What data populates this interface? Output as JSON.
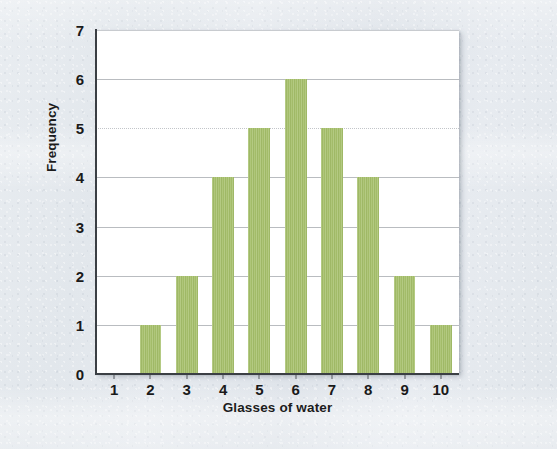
{
  "chart_data": {
    "type": "bar",
    "title": "",
    "subtitle": "",
    "xlabel": "Glasses of water",
    "ylabel": "Frequency",
    "categories": [
      "1",
      "2",
      "3",
      "4",
      "5",
      "6",
      "7",
      "8",
      "9",
      "10"
    ],
    "values": [
      0,
      1,
      2,
      4,
      5,
      6,
      5,
      4,
      2,
      1
    ],
    "series": [
      {
        "name": "Frequency",
        "values": [
          0,
          1,
          2,
          4,
          5,
          6,
          5,
          4,
          2,
          1
        ]
      }
    ],
    "xlim": [
      0.5,
      10.5
    ],
    "ylim": [
      0,
      7
    ],
    "ytick_labels": [
      "0",
      "1",
      "2",
      "3",
      "4",
      "5",
      "6",
      "7"
    ],
    "ytick_values": [
      0,
      1,
      2,
      3,
      4,
      5,
      6,
      7
    ],
    "xtick_labels": [
      "1",
      "2",
      "3",
      "4",
      "5",
      "6",
      "7",
      "8",
      "9",
      "10"
    ],
    "grid": "horizontal",
    "legend": "none",
    "annotations": [],
    "total_count": 30,
    "mode": 6,
    "colors": {
      "bar_fill": "#a6c06b",
      "plot_background": "#ffffff",
      "page_background": "#e6eaee",
      "axis_line": "#3b3f44",
      "gridline": "#b9bcc0",
      "text": "#1a1a1a"
    }
  }
}
